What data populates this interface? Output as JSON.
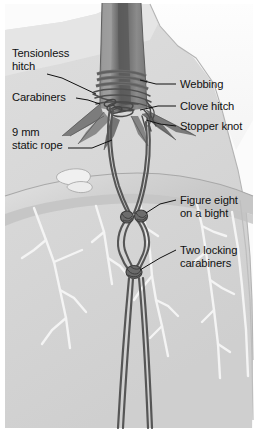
{
  "figure": {
    "width": 258,
    "height": 435,
    "colors": {
      "background": "#ffffff",
      "rock_face": "#d9d9d9",
      "rock_ledge_top": "#c9c9c9",
      "rock_highlight": "#f2f2f2",
      "crack_white": "#f5f5f5",
      "trunk": "#8d8d8d",
      "trunk_shadow": "#6a6a6a",
      "trunk_dark_stripe": "#5d5d5d",
      "webbing": "#7d7d7d",
      "rope": "#565656",
      "outline": "#4a4a4a",
      "label_text": "#111111",
      "leader_line": "#111111",
      "sky_white": "#fdfdfd"
    }
  },
  "labels": {
    "tensionless_hitch": "Tensionless\nhitch",
    "carabiners": "Carabiners",
    "static_rope": "9 mm\nstatic rope",
    "webbing": "Webbing",
    "clove_hitch": "Clove hitch",
    "stopper_knot": "Stopper knot",
    "figure_eight": "Figure eight\non a bight",
    "two_locking_carabiners": "Two locking\ncarabiners"
  },
  "parts": {
    "tree_trunk": "tree-trunk",
    "webbing_wraps": "webbing-wraps",
    "rope_wraps": "rope-wraps",
    "knot_cluster": "knot-cluster",
    "rope_strands": "rope-strands",
    "figure_eight_loop": "figure-eight-loop",
    "carabiner_upper_left": "carabiner-upper-left",
    "carabiner_upper_right": "carabiner-upper-right",
    "carabiner_lower": "carabiner-lower",
    "rock_ledge": "rock-ledge",
    "rock_cliff_face": "rock-cliff-face",
    "pebbles": "pebbles"
  }
}
